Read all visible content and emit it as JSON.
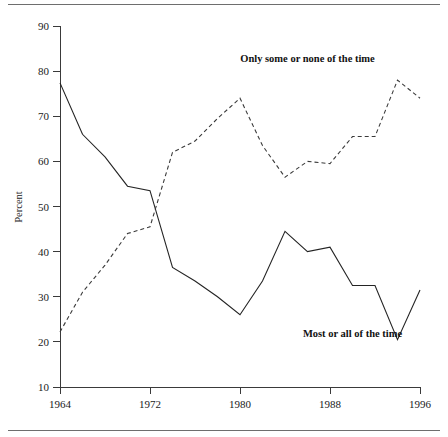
{
  "chart_data": {
    "type": "line",
    "title": "",
    "subtitle": "",
    "xlabel": "",
    "ylabel": "Percent",
    "xlim": [
      1964,
      1996
    ],
    "ylim": [
      10,
      90
    ],
    "ytick_labels": [
      "90",
      "80",
      "70",
      "60",
      "50",
      "40",
      "30",
      "20",
      "10"
    ],
    "yticks": [
      90,
      80,
      70,
      60,
      50,
      40,
      30,
      20,
      10
    ],
    "xtick_labels": [
      "1964",
      "1972",
      "1980",
      "1988",
      "1996"
    ],
    "xticks": [
      1964,
      1972,
      1980,
      1988,
      1996
    ],
    "grid": false,
    "legend_position": "inline-annotations",
    "annotations": [
      {
        "text": "Only some or none of the time",
        "x": 1986,
        "y": 82
      },
      {
        "text": "Most or all of the time",
        "x": 1990,
        "y": 21
      }
    ],
    "series": [
      {
        "name": "Most or all of the time",
        "style": "solid",
        "color": "#242424",
        "x": [
          1964,
          1966,
          1968,
          1970,
          1972,
          1974,
          1976,
          1978,
          1980,
          1982,
          1984,
          1986,
          1988,
          1990,
          1992,
          1994,
          1996
        ],
        "values": [
          77.4,
          66.0,
          61.0,
          54.5,
          53.5,
          36.5,
          33.5,
          30.0,
          26.0,
          33.5,
          44.5,
          40.0,
          41.0,
          32.5,
          32.5,
          20.5,
          31.5
        ]
      },
      {
        "name": "Only some or none of the time",
        "style": "dashed",
        "color": "#3a3a3a",
        "x": [
          1964,
          1966,
          1968,
          1970,
          1972,
          1974,
          1976,
          1978,
          1980,
          1982,
          1984,
          1986,
          1988,
          1990,
          1992,
          1994,
          1996
        ],
        "values": [
          22.2,
          31.0,
          37.0,
          44.0,
          45.5,
          62.0,
          64.5,
          69.5,
          74.0,
          63.5,
          56.5,
          60.0,
          59.5,
          65.5,
          65.5,
          78.0,
          74.0
        ]
      }
    ]
  }
}
